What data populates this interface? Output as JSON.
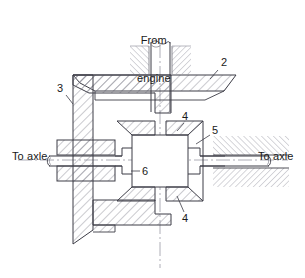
{
  "figure": {
    "type": "engineering-cross-section",
    "background_color": "#ffffff",
    "line_color": "#3c3c46",
    "hatch_color": "#6e6e78",
    "centerline_color": "#8a8a94"
  },
  "text_labels": {
    "from_engine_line1": "From",
    "from_engine_line2": "engine",
    "to_axle_left": "To axle",
    "to_axle_right": "To axle"
  },
  "callouts": [
    {
      "id": "callout-2",
      "number": "2",
      "x": 221,
      "y": 63
    },
    {
      "id": "callout-3",
      "number": "3",
      "x": 57,
      "y": 89
    },
    {
      "id": "callout-4-top",
      "number": "4",
      "x": 183,
      "y": 116
    },
    {
      "id": "callout-5",
      "number": "5",
      "x": 212,
      "y": 130
    },
    {
      "id": "callout-6",
      "number": "6",
      "x": 142,
      "y": 172
    },
    {
      "id": "callout-4-bottom",
      "number": "4",
      "x": 183,
      "y": 215
    }
  ],
  "parts": {
    "part_2_name": "driven cone plate",
    "part_3_name": "housing wall",
    "part_4_name": "tapered roller / cone",
    "part_5_name": "output hub",
    "part_6_name": "central chamber"
  }
}
